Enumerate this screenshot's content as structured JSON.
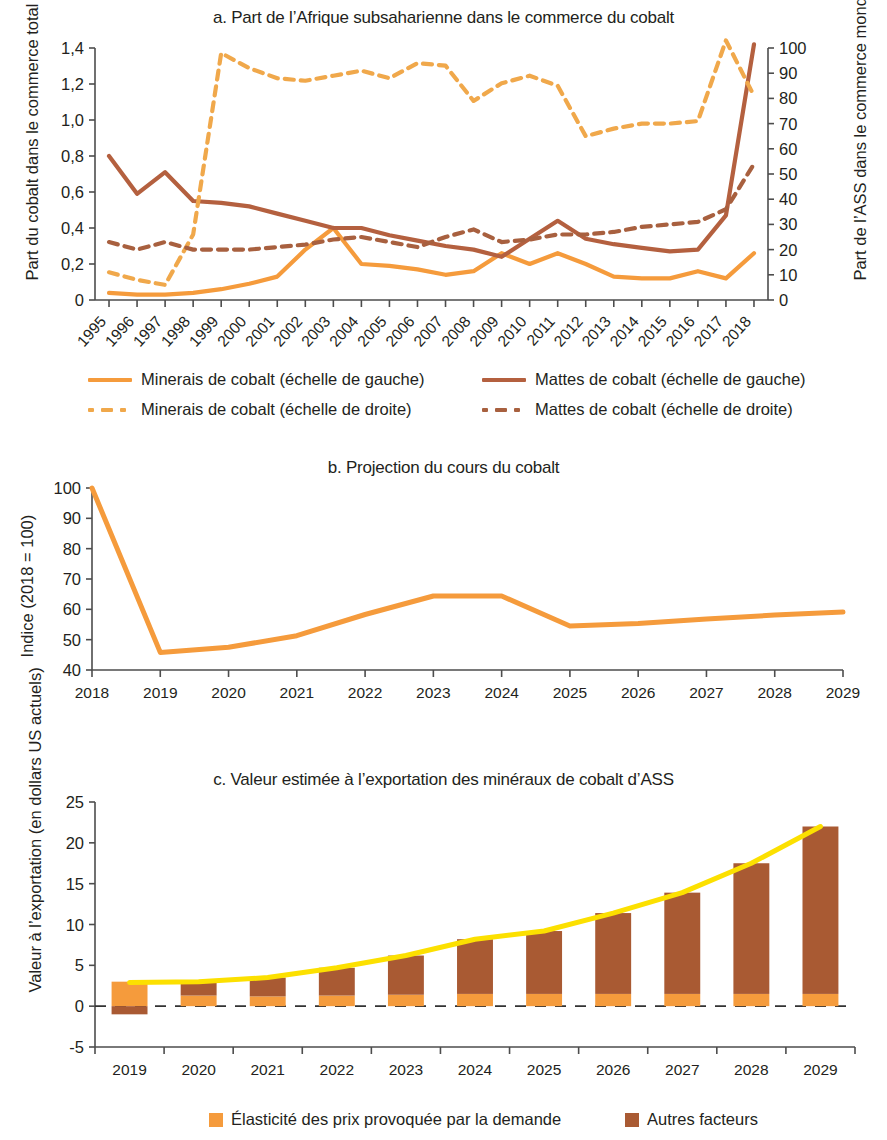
{
  "colors": {
    "minerais": "#F59B3C",
    "mattes": "#B4603F",
    "bar_bottom": "#F59B3C",
    "bar_top": "#A95A33",
    "trend": "#FCE000",
    "axis": "#4d4d4d",
    "text": "#231f20"
  },
  "panel_a": {
    "title": "a. Part de l’Afrique subsaharienne dans le commerce du cobalt",
    "ylabel_left": "Part du cobalt dans le commerce total de l’ASS",
    "ylabel_right": "Part de l’ASS dans le commerce mondial de cobalt (%)",
    "legend": [
      {
        "label": "Minerais de cobalt (échelle de gauche)",
        "style": "solid",
        "color": "#F59B3C"
      },
      {
        "label": "Mattes de cobalt (échelle de gauche)",
        "style": "solid",
        "color": "#B4603F"
      },
      {
        "label": "Minerais de cobalt (échelle de droite)",
        "style": "dashed",
        "color": "#F0A84B"
      },
      {
        "label": "Mattes de cobalt (échelle de droite)",
        "style": "dashed",
        "color": "#A8603F"
      }
    ]
  },
  "panel_b": {
    "title": "b. Projection du cours du cobalt",
    "ylabel": "Indice (2018 = 100)"
  },
  "panel_c": {
    "title": "c. Valeur estimée à l’exportation des minéraux de cobalt d’ASS",
    "ylabel": "Valeur à l’exportation (en dollars US actuels)",
    "legend": [
      {
        "label": "Élasticité des prix provoquée par la demande",
        "color": "#F59B3C"
      },
      {
        "label": "Autres facteurs",
        "color": "#A95A33"
      }
    ]
  },
  "chart_data": [
    {
      "type": "line",
      "title": "a. Part de l’Afrique subsaharienne dans le commerce du cobalt",
      "xlabel": "",
      "ylabel": "Part du cobalt dans le commerce total de l’ASS",
      "y2label": "Part de l’ASS dans le commerce mondial de cobalt (%)",
      "x": [
        1995,
        1996,
        1997,
        1998,
        1999,
        2000,
        2001,
        2002,
        2003,
        2004,
        2005,
        2006,
        2007,
        2008,
        2009,
        2010,
        2011,
        2012,
        2013,
        2014,
        2015,
        2016,
        2017,
        2018
      ],
      "ylim": [
        0,
        1.4
      ],
      "yticks": [
        "0",
        "0,2",
        "0,4",
        "0,6",
        "0,8",
        "1,0",
        "1,2",
        "1,4"
      ],
      "y2lim": [
        0,
        100
      ],
      "y2ticks": [
        "0",
        "10",
        "20",
        "30",
        "40",
        "50",
        "60",
        "70",
        "80",
        "90",
        "100"
      ],
      "grid": false,
      "legend_position": "below",
      "series": [
        {
          "name": "Minerais de cobalt (échelle de gauche)",
          "axis": "left",
          "style": "solid",
          "color": "#F59B3C",
          "values": [
            0.04,
            0.03,
            0.03,
            0.04,
            0.06,
            0.09,
            0.13,
            0.28,
            0.4,
            0.2,
            0.19,
            0.17,
            0.14,
            0.16,
            0.26,
            0.2,
            0.26,
            0.2,
            0.13,
            0.12,
            0.12,
            0.16,
            0.12,
            0.26
          ]
        },
        {
          "name": "Mattes de cobalt (échelle de gauche)",
          "axis": "left",
          "style": "solid",
          "color": "#B4603F",
          "values": [
            0.8,
            0.59,
            0.71,
            0.55,
            0.54,
            0.52,
            0.48,
            0.44,
            0.4,
            0.4,
            0.36,
            0.33,
            0.3,
            0.28,
            0.24,
            0.34,
            0.44,
            0.34,
            0.31,
            0.29,
            0.27,
            0.28,
            0.47,
            1.42
          ]
        },
        {
          "name": "Minerais de cobalt (échelle de droite)",
          "axis": "right",
          "style": "dashed",
          "color": "#F0A84B",
          "values": [
            11,
            8,
            6,
            26,
            98,
            92,
            88,
            87,
            89,
            91,
            88,
            94,
            93,
            79,
            86,
            89,
            85,
            65,
            68,
            70,
            70,
            71,
            103,
            81
          ]
        },
        {
          "name": "Mattes de cobalt (échelle de droite)",
          "axis": "right",
          "style": "dashed",
          "color": "#A8603F",
          "values": [
            23,
            20,
            23,
            20,
            20,
            20,
            21,
            22,
            24,
            25,
            23,
            21,
            25,
            28,
            23,
            24,
            26,
            26,
            27,
            29,
            30,
            31,
            36,
            54
          ]
        }
      ]
    },
    {
      "type": "line",
      "title": "b. Projection du cours du cobalt",
      "xlabel": "",
      "ylabel": "Indice (2018 = 100)",
      "x": [
        2018,
        2019,
        2020,
        2021,
        2022,
        2023,
        2024,
        2025,
        2026,
        2027,
        2028,
        2029
      ],
      "values": [
        100,
        45.8,
        47.5,
        51.3,
        58.3,
        64.4,
        64.4,
        54.5,
        55.3,
        56.8,
        58.1,
        59.1
      ],
      "ylim": [
        40,
        100
      ],
      "yticks": [
        "40",
        "50",
        "60",
        "70",
        "80",
        "90",
        "100"
      ],
      "grid": false,
      "legend_position": "none",
      "series": [
        {
          "name": "Cours du cobalt",
          "style": "solid",
          "color": "#F59B3C",
          "values": [
            100,
            45.8,
            47.5,
            51.3,
            58.3,
            64.4,
            64.4,
            54.5,
            55.3,
            56.8,
            58.1,
            59.1
          ]
        }
      ]
    },
    {
      "type": "bar",
      "title": "c. Valeur estimée à l’exportation des minéraux de cobalt d’ASS",
      "xlabel": "",
      "ylabel": "Valeur à l’exportation (en dollars US actuels)",
      "categories": [
        "2019",
        "2020",
        "2021",
        "2022",
        "2023",
        "2024",
        "2025",
        "2026",
        "2027",
        "2028",
        "2029"
      ],
      "ylim": [
        -5,
        25
      ],
      "yticks": [
        "-5",
        "0",
        "5",
        "10",
        "15",
        "20",
        "25"
      ],
      "stacked": true,
      "grid": false,
      "legend_position": "below",
      "series": [
        {
          "name": "Élasticité des prix provoquée par la demande",
          "color": "#F59B3C",
          "values": [
            3.0,
            1.3,
            1.2,
            1.3,
            1.4,
            1.5,
            1.5,
            1.5,
            1.5,
            1.5,
            1.5
          ]
        },
        {
          "name": "Autres facteurs",
          "color": "#A95A33",
          "values": [
            -1.0,
            1.7,
            2.3,
            3.4,
            4.8,
            6.7,
            7.7,
            9.9,
            12.4,
            16.0,
            20.5
          ]
        }
      ],
      "overlay_line": {
        "name": "Total",
        "color": "#FCE000",
        "values": [
          2.9,
          3.0,
          3.5,
          4.7,
          6.2,
          8.2,
          9.2,
          11.4,
          13.9,
          17.5,
          22.0
        ]
      }
    }
  ]
}
